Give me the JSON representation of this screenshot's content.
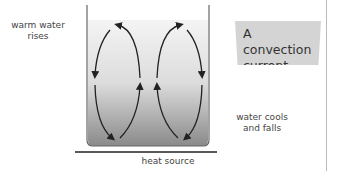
{
  "diagram": {
    "title": "A convection current",
    "title_lines": [
      "A convection",
      "current"
    ],
    "labels": {
      "warm_rising": [
        "warm water",
        "rises"
      ],
      "cool_falling": [
        "water cools",
        "and falls"
      ],
      "heat_source": "heat source"
    },
    "colors": {
      "water_top": "#f2f2f2",
      "water_bottom": "#8a8a8a",
      "arrow": "#222222",
      "title_box": "#d4d4d4"
    }
  }
}
